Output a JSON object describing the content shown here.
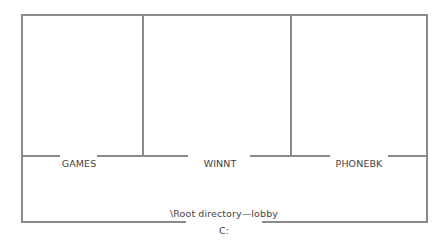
{
  "diagram": {
    "type": "floor-plan-directory-metaphor",
    "line_color": "#8a8a8a",
    "text_color": "#444444",
    "rooms": [
      {
        "label": "GAMES"
      },
      {
        "label": "WINNT"
      },
      {
        "label": "PHONEBK"
      }
    ],
    "lobby": {
      "label": "\\Root directory—lobby"
    },
    "entrance": {
      "label": "C:"
    }
  }
}
